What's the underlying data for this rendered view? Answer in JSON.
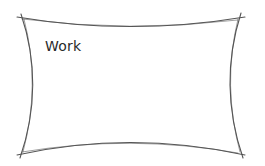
{
  "node": {
    "label": "Work",
    "shape": "sketchy-concave-rectangle",
    "stroke_color": "#555555",
    "fill_color": "#ffffff"
  }
}
